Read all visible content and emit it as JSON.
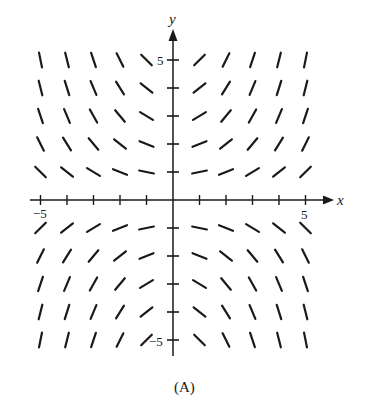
{
  "figure": {
    "caption": "(A)",
    "type": "slope-field",
    "x_axis_label": "x",
    "y_axis_label": "y",
    "x_tick_labels": {
      "min": "−5",
      "max": "5"
    },
    "y_tick_labels": {
      "max": "5",
      "min": "−5"
    },
    "colors": {
      "ink": "#1a1a1a",
      "background": "#ffffff"
    }
  },
  "slope_field": {
    "x_range": [
      -5,
      5
    ],
    "y_range": [
      -5,
      5
    ],
    "grid_x": [
      -5,
      -4,
      -3,
      -2,
      -1,
      1,
      2,
      3,
      4,
      5
    ],
    "grid_y": [
      -5,
      -4,
      -3,
      -2,
      -1,
      1,
      2,
      3,
      4,
      5
    ],
    "slope_model": "dy/dx ≈ x·y / 5",
    "slope_scale": 0.2
  }
}
